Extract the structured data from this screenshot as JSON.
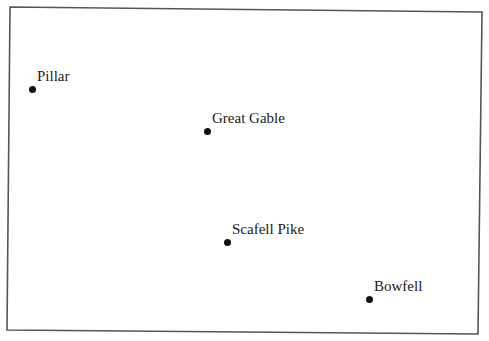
{
  "map": {
    "frame": {
      "corners": {
        "top_left": [
          10,
          7
        ],
        "top_right": [
          482,
          12
        ],
        "bottom_right": [
          478,
          334
        ],
        "bottom_left": [
          7,
          330
        ]
      },
      "stroke_color": "#555555"
    },
    "marker_color": "#111111",
    "label_color": "#222222",
    "points": [
      {
        "name": "Pillar",
        "x": 32,
        "y": 89
      },
      {
        "name": "Great Gable",
        "x": 207,
        "y": 131
      },
      {
        "name": "Scafell Pike",
        "x": 227,
        "y": 242
      },
      {
        "name": "Bowfell",
        "x": 369,
        "y": 299
      }
    ]
  }
}
